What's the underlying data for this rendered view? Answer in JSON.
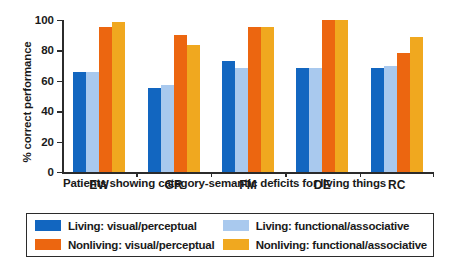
{
  "chart_data": {
    "type": "bar",
    "title": "",
    "xlabel": "Patients showing category-semantic deficits for living things",
    "ylabel": "% correct performance",
    "categories": [
      "EW",
      "GR",
      "FM",
      "DE",
      "RC"
    ],
    "ylim": [
      0,
      100
    ],
    "yticks": [
      0,
      20,
      40,
      60,
      80,
      100
    ],
    "ytick_labels": [
      "0",
      "20",
      "40",
      "60",
      "80",
      "100"
    ],
    "grid": false,
    "legend_position": "bottom",
    "series": [
      {
        "name": "Living: visual/perceptual",
        "color": "#1266c0",
        "values": [
          65.5,
          55.0,
          73.0,
          68.5,
          68.5
        ]
      },
      {
        "name": "Living: functional/associative",
        "color": "#a9c9ee",
        "values": [
          65.5,
          57.5,
          68.5,
          68.5,
          69.5
        ]
      },
      {
        "name": "Nonliving: visual/perceptual",
        "color": "#ec6610",
        "values": [
          95.5,
          90.0,
          95.5,
          100.0,
          78.0
        ]
      },
      {
        "name": "Nonliving: functional/associative",
        "color": "#f0a81f",
        "values": [
          98.5,
          83.5,
          95.5,
          100.0,
          89.0
        ]
      }
    ]
  },
  "legend": {
    "items": [
      {
        "label": "Living: visual/perceptual",
        "swatch": "s0"
      },
      {
        "label": "Living: functional/associative",
        "swatch": "s1"
      },
      {
        "label": "Nonliving: visual/perceptual",
        "swatch": "s2"
      },
      {
        "label": "Nonliving: functional/associative",
        "swatch": "s3"
      }
    ]
  }
}
